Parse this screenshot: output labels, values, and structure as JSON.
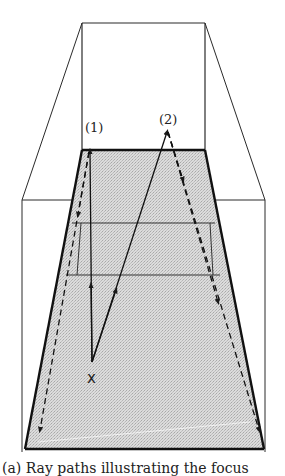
{
  "figure": {
    "labels": {
      "path1": "(1)",
      "path2": "(2)",
      "origin": "x"
    },
    "caption": "(a) Ray paths illustrating the focus"
  }
}
